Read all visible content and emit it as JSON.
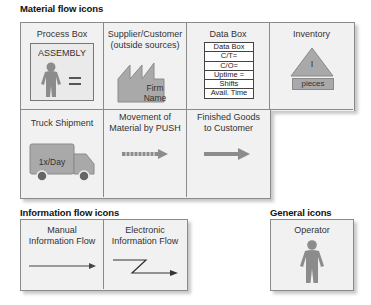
{
  "sections": {
    "material": {
      "title": "Material flow icons",
      "cells": [
        {
          "label": "Process Box",
          "icon": "process-box-icon",
          "inner_label": "ASSEMBLY"
        },
        {
          "label": "Supplier/Customer\n(outside sources)",
          "label_line1": "Supplier/Customer",
          "label_line2": "(outside sources)",
          "icon": "factory-icon",
          "inner_line1": "Firm",
          "inner_line2": "Name"
        },
        {
          "label": "Data Box",
          "icon": "data-box-icon",
          "rows": [
            "Data Box",
            "C/T=",
            "C/O=",
            "Uptime =",
            "Shifts",
            "Avail. Time"
          ]
        },
        {
          "label": "Inventory",
          "icon": "inventory-triangle-icon",
          "inner_label": "I",
          "sub_label": "pieces"
        },
        {
          "label": "Truck Shipment",
          "icon": "truck-icon",
          "inner_label": "1x/Day"
        },
        {
          "label_line1": "Movement of",
          "label_line2": "Material by PUSH",
          "icon": "push-arrow-icon"
        },
        {
          "label_line1": "Finished Goods",
          "label_line2": "to Customer",
          "icon": "shipment-arrow-icon"
        }
      ]
    },
    "information": {
      "title": "Information flow icons",
      "cells": [
        {
          "label_line1": "Manual",
          "label_line2": "Information Flow",
          "icon": "manual-info-arrow-icon"
        },
        {
          "label_line1": "Electronic",
          "label_line2": "Information Flow",
          "icon": "electronic-info-arrow-icon"
        }
      ]
    },
    "general": {
      "title": "General icons",
      "cells": [
        {
          "label": "Operator",
          "icon": "operator-icon"
        }
      ]
    }
  },
  "colors": {
    "icon_fill": "#8c8c8c",
    "cell_bg": "#f1f1f1",
    "border": "#8a8a8a",
    "text": "#222222"
  }
}
